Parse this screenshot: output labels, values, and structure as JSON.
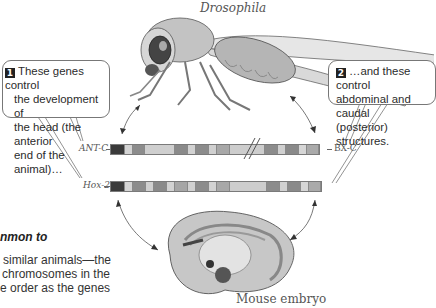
{
  "title": "Drosophila",
  "bottom_label": "Mouse embryo",
  "callouts": [
    {
      "number": "1",
      "lines": [
        "These genes control",
        "the development of",
        "the head (the anterior",
        "end of the animal)…"
      ]
    },
    {
      "number": "2",
      "lines": [
        "…and these control",
        "abdominal and caudal",
        "(posterior) structures."
      ]
    }
  ],
  "chromosomes": {
    "top_left_label": "ANT-C",
    "top_right_label": "BX-C",
    "bottom_left_label": "Hox-2",
    "top_segments": [
      {
        "w": 14,
        "c": "#3a3a3a"
      },
      {
        "w": 8,
        "c": "#d4d4d4"
      },
      {
        "w": 12,
        "c": "#8c8c8c"
      },
      {
        "w": 30,
        "c": "#cfcfcf"
      },
      {
        "w": 13,
        "c": "#8a8a8a"
      },
      {
        "w": 8,
        "c": "#d2d2d2"
      },
      {
        "w": 13,
        "c": "#8c8c8c"
      },
      {
        "w": 8,
        "c": "#d0d0d0"
      },
      {
        "w": 13,
        "c": "#a8a8a8"
      },
      {
        "w": 35,
        "c": "#cdcdcd"
      },
      {
        "w": 13,
        "c": "#8c8c8c"
      },
      {
        "w": 8,
        "c": "#d0d0d0"
      },
      {
        "w": 13,
        "c": "#8a8a8a"
      },
      {
        "w": 8,
        "c": "#d6d6d6"
      },
      {
        "w": 12,
        "c": "#aaaaaa"
      }
    ],
    "bottom_segments": [
      {
        "w": 14,
        "c": "#3a3a3a"
      },
      {
        "w": 8,
        "c": "#d4d4d4"
      },
      {
        "w": 13,
        "c": "#8c8c8c"
      },
      {
        "w": 8,
        "c": "#d0d0d0"
      },
      {
        "w": 13,
        "c": "#8a8a8a"
      },
      {
        "w": 8,
        "c": "#d2d2d2"
      },
      {
        "w": 13,
        "c": "#a6a6a6"
      },
      {
        "w": 8,
        "c": "#d0d0d0"
      },
      {
        "w": 13,
        "c": "#8c8c8c"
      },
      {
        "w": 8,
        "c": "#d2d2d2"
      },
      {
        "w": 13,
        "c": "#a8a8a8"
      },
      {
        "w": 37,
        "c": "#cdcdcd"
      },
      {
        "w": 13,
        "c": "#8c8c8c"
      },
      {
        "w": 8,
        "c": "#d0d0d0"
      },
      {
        "w": 13,
        "c": "#8a8a8a"
      },
      {
        "w": 8,
        "c": "#d6d6d6"
      },
      {
        "w": 12,
        "c": "#aaaaaa"
      }
    ]
  },
  "side_text": {
    "heading": "nmon to",
    "lines": [
      "similar animals—the",
      "chromosomes in the",
      "e order as the genes"
    ]
  }
}
